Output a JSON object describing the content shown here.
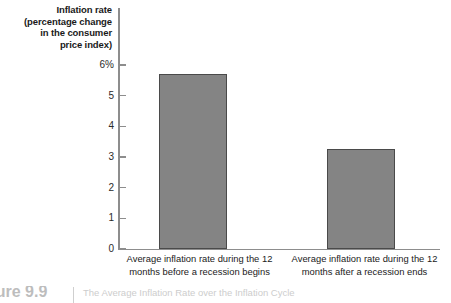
{
  "chart_data": {
    "type": "bar",
    "title": "",
    "xlabel": "",
    "ylabel": "Inflation rate (percentage change in the consumer price index)",
    "ylabel_lines": [
      "Inflation rate",
      "(percentage change",
      "in the consumer",
      "price index)"
    ],
    "categories": [
      "Average inflation rate during the 12 months before a recession begins",
      "Average inflation rate during the 12 months after a recession ends"
    ],
    "category_lines": [
      [
        "Average inflation rate during the 12",
        "months before a recession begins"
      ],
      [
        "Average inflation rate during the 12",
        "months after a recession ends"
      ]
    ],
    "values": [
      5.7,
      3.25
    ],
    "ylim": [
      0,
      6
    ],
    "yticks": [
      0,
      1,
      2,
      3,
      4,
      5,
      6
    ],
    "ytick_labels": [
      "0",
      "1",
      "2",
      "3",
      "4",
      "5",
      "6%"
    ],
    "grid": false,
    "legend": null,
    "bar_color": "#848484",
    "bar_edge_color": "#4a4a4a",
    "axis_color": "#8d8d8d",
    "background": "#ffffff"
  },
  "caption": {
    "number": "gure 9.9",
    "text": "The Average Inflation Rate over the Inflation Cycle"
  }
}
